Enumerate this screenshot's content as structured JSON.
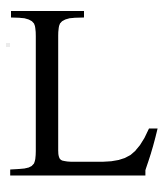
{
  "image": {
    "kind": "glyph-specimen",
    "character": "L",
    "description": "Capital letter L, serif typeface, black on white",
    "width": 168,
    "height": 187
  },
  "colors": {
    "foreground": "#000000",
    "background": "#ffffff",
    "artifact": "#e8e8e8"
  },
  "glyph": {
    "label": "L",
    "name": "latin-capital-letter-l",
    "style": "serif",
    "weight": "regular",
    "fill": "#000000",
    "outline_path": "M 11.0 11.0 L 84.0 11.0 L 84.0 17.4 L 75.0 17.8 Q 63.0 18.4 60.0 23.5 Q 58.2 27.0 58.2 36.0 L 58.2 150.5 Q 58.2 157.5 60.5 159.6 Q 62.8 161.6 71.0 161.8 L 103.0 161.8 Q 120.5 161.6 130.5 155.0 Q 140.5 148.2 149.0 128.6 L 157.6 128.6 Q 153.0 148.0 148.4 161.2 Q 146.2 167.6 145.4 170.2 L 145.4 175.6 L 10.2 175.6 L 10.2 169.4 L 19.0 169.0 Q 31.0 168.4 34.0 163.4 Q 35.8 160.0 35.8 151.0 L 35.8 36.0 Q 35.8 27.0 34.0 23.5 Q 31.0 18.4 19.0 17.8 L 11.0 17.4 Z"
  },
  "artifacts": [
    {
      "name": "scan-speck",
      "x": 6,
      "y": 43,
      "size": 4
    }
  ]
}
